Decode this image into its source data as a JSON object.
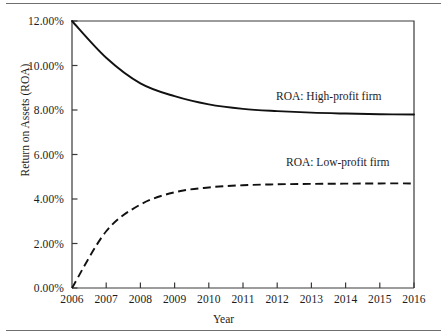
{
  "figure": {
    "width": 447,
    "height": 334,
    "background": "#ffffff",
    "rule_color": "#6f6f6f",
    "line_color": "#111111",
    "axis_color": "#3a3a3a"
  },
  "chart_data": {
    "type": "line",
    "title": "",
    "xlabel": "Year",
    "ylabel": "Return on Assets (ROA)",
    "x": [
      2006,
      2007,
      2008,
      2009,
      2010,
      2011,
      2012,
      2013,
      2014,
      2015,
      2016
    ],
    "categories": [
      "2006",
      "2007",
      "2008",
      "2009",
      "2010",
      "2011",
      "2012",
      "2013",
      "2014",
      "2015",
      "2016"
    ],
    "xtick_labels": [
      "2006",
      "2007",
      "2008",
      "2009",
      "2010",
      "2011",
      "2012",
      "2013",
      "2014",
      "2015",
      "2016"
    ],
    "ytick_labels": [
      "0.00%",
      "2.00%",
      "4.00%",
      "6.00%",
      "8.00%",
      "10.00%",
      "12.00%"
    ],
    "ytick_values": [
      0,
      2,
      4,
      6,
      8,
      10,
      12
    ],
    "xlim": [
      2006,
      2016
    ],
    "ylim": [
      0,
      12
    ],
    "grid": false,
    "legend_position": "inline-annotation",
    "series": [
      {
        "name": "ROA: High-profit firm",
        "label": "ROA: High-profit firm",
        "style": "solid",
        "color": "#111111",
        "values": [
          12.0,
          10.35,
          9.2,
          8.62,
          8.25,
          8.05,
          7.95,
          7.88,
          7.84,
          7.81,
          7.8
        ]
      },
      {
        "name": "ROA: Low-profit firm",
        "label": "ROA: Low-profit firm",
        "style": "dashed",
        "color": "#111111",
        "values": [
          0.0,
          2.55,
          3.75,
          4.3,
          4.52,
          4.62,
          4.66,
          4.68,
          4.69,
          4.7,
          4.7
        ]
      }
    ]
  }
}
